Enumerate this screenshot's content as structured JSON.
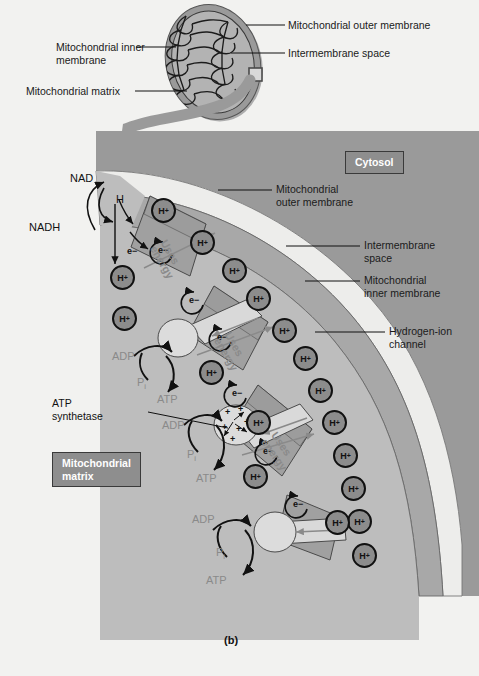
{
  "figure": {
    "caption": "(b)",
    "background_color": "#f2f2f0"
  },
  "inset": {
    "labels": [
      {
        "id": "outer-membrane",
        "text": "Mitochondrial outer membrane"
      },
      {
        "id": "intermembrane-space",
        "text": "Intermembrane space"
      },
      {
        "id": "inner-membrane",
        "text": "Mitochondrial inner\nmembrane"
      },
      {
        "id": "inner-membrane-line1",
        "text": "Mitochondrial inner"
      },
      {
        "id": "inner-membrane-line2",
        "text": "membrane"
      },
      {
        "id": "matrix",
        "text": "Mitochondrial matrix"
      }
    ]
  },
  "main": {
    "region_boxes": [
      {
        "id": "cytosol",
        "text": "Cytosol",
        "color": "#8e8e8e"
      },
      {
        "id": "mitochondrial-matrix",
        "line1": "Mitochondrial",
        "line2": "matrix",
        "color": "#8e8e8e"
      }
    ],
    "leader_labels": [
      {
        "id": "outer-membrane",
        "line1": "Mitochondrial",
        "line2": "outer membrane"
      },
      {
        "id": "intermembrane-space",
        "line1": "Intermembrane",
        "line2": "space"
      },
      {
        "id": "inner-membrane",
        "line1": "Mitochondrial",
        "line2": "inner membrane"
      },
      {
        "id": "hydrogen-ion-channel",
        "line1": "Hydrogen-ion",
        "line2": "channel"
      }
    ],
    "molecules": {
      "nad": "NAD",
      "nadh": "NADH",
      "hydrogen": "H",
      "electron": "e−",
      "proton": "H+"
    },
    "enzyme": {
      "line1": "ATP",
      "line2": "synthetase"
    },
    "pump_label": {
      "line1": "Uses",
      "line2": "energy"
    },
    "atp_cycles": [
      {
        "id": "cycle-top",
        "adp": "ADP",
        "phosphate": "P",
        "phosphate_sub": "i",
        "atp": "ATP"
      },
      {
        "id": "cycle-middle",
        "adp": "ADP",
        "phosphate": "P",
        "phosphate_sub": "i",
        "atp": "ATP"
      },
      {
        "id": "cycle-bottom",
        "adp": "ADP",
        "phosphate": "P",
        "phosphate_sub": "i",
        "atp": "ATP"
      }
    ],
    "proton_count_intermembrane": 13,
    "proton_count_matrix": 2
  },
  "colors": {
    "background": "#f2f2f0",
    "outer_membrane": "#9a9a9a",
    "intermembrane_space": "#ededeb",
    "inner_membrane": "#a8a8a8",
    "matrix": "#bdbdbd",
    "pump_complex": "#a0a0a0",
    "ion_fill": "#8c8c8c",
    "label_box": "#8e8e8e",
    "gray_text": "#8a8a8a",
    "black_text": "#111111"
  }
}
